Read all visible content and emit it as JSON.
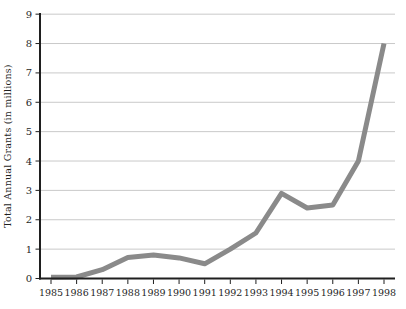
{
  "chart_data": {
    "type": "line",
    "categories": [
      "1985",
      "1986",
      "1987",
      "1988",
      "1989",
      "1990",
      "1991",
      "1992",
      "1993",
      "1994",
      "1995",
      "1996",
      "1997",
      "1998"
    ],
    "values": [
      0,
      0.05,
      0.3,
      0.72,
      0.8,
      0.7,
      0.5,
      1.0,
      1.55,
      2.9,
      2.4,
      2.5,
      4.0,
      8.0
    ],
    "ylabel": "Total Annual Grants (in millions)",
    "xlabel": "",
    "ylim": [
      0,
      9
    ],
    "yticks": [
      0,
      1,
      2,
      3,
      4,
      5,
      6,
      7,
      8,
      9
    ],
    "grid": true,
    "legend": "none",
    "colors": {
      "line": "#8a8a8a",
      "axis": "#1f1f1f",
      "grid": "#c9c9c9",
      "text": "#1f1f1f",
      "background": "#ffffff"
    }
  }
}
